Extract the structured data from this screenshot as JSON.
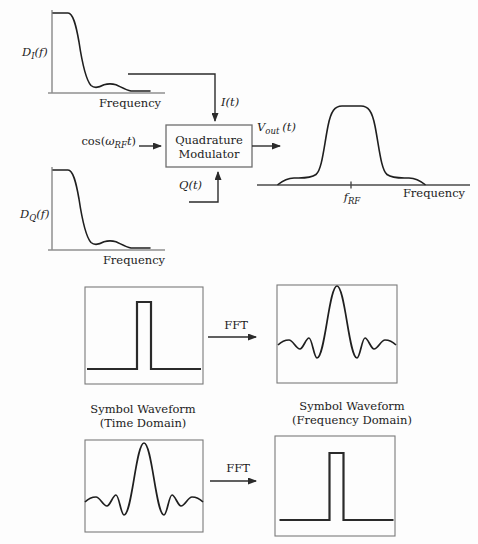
{
  "window": {
    "width": 478,
    "height": 544
  },
  "colors": {
    "ink": "#1c1c1c",
    "axis_gray": "#8f8f8f",
    "box_gray": "#6e6e6e",
    "background": "#fdfdfd"
  },
  "quadrature_diagram": {
    "i_spectrum": {
      "sym": "D",
      "sub": "I",
      "arg": "(f)",
      "axis_label": "Frequency"
    },
    "q_spectrum": {
      "sym": "D",
      "sub": "Q",
      "arg": "(f)",
      "axis_label": "Frequency"
    },
    "i_signal": {
      "sym": "I",
      "arg": "(t)"
    },
    "q_signal": {
      "sym": "Q",
      "arg": "(t)"
    },
    "carrier": {
      "fn": "cos(",
      "omega": "ω",
      "sub": "RF",
      "var": "t",
      "close": ")"
    },
    "modulator": {
      "line1": "Quadrature",
      "line2": "Modulator"
    },
    "output_signal": {
      "sym": "V",
      "sub": "out",
      "arg": "(t)"
    },
    "output_spectrum": {
      "center": {
        "sym": "f",
        "sub": "RF"
      },
      "axis_label": "Frequency"
    }
  },
  "fft_diagram": {
    "fft_label": "FFT",
    "time_caption": {
      "line1": "Symbol Waveform",
      "line2": "(Time Domain)"
    },
    "freq_caption": {
      "line1": "Symbol Waveform",
      "line2": "(Frequency Domain)"
    }
  }
}
